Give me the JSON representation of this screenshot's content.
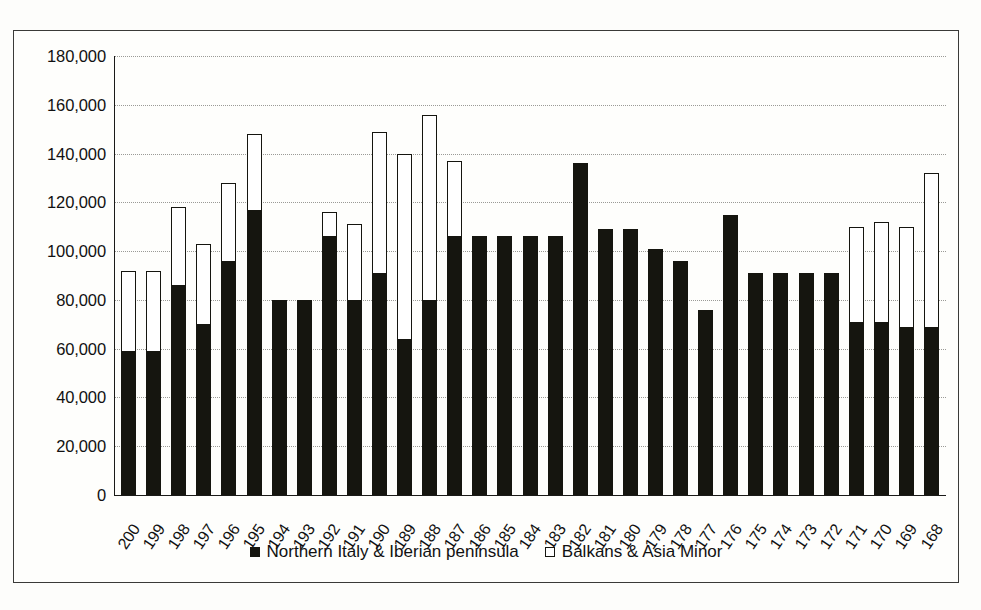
{
  "chart_data": {
    "type": "bar",
    "subtype": "stacked",
    "title": "",
    "xlabel": "",
    "ylabel": "",
    "ylim": [
      0,
      180000
    ],
    "ytick_step": 20000,
    "ytick_labels": [
      "180,000",
      "160,000",
      "140,000",
      "120,000",
      "100,000",
      "80,000",
      "60,000",
      "40,000",
      "20,000",
      "0"
    ],
    "ytick_values": [
      180000,
      160000,
      140000,
      120000,
      100000,
      80000,
      60000,
      40000,
      20000,
      0
    ],
    "grid": true,
    "grid_axis": "y",
    "legend_position": "bottom-center",
    "categories": [
      "200",
      "199",
      "198",
      "197",
      "196",
      "195",
      "194",
      "193",
      "192",
      "191",
      "190",
      "189",
      "188",
      "187",
      "186",
      "185",
      "184",
      "183",
      "182",
      "181",
      "180",
      "179",
      "178",
      "177",
      "176",
      "175",
      "174",
      "173",
      "172",
      "171",
      "170",
      "169",
      "168"
    ],
    "series": [
      {
        "name": "Northern Italy & Iberian peninsula",
        "marker": "filled-square",
        "color": "#15150f",
        "values": [
          59000,
          59000,
          86000,
          70000,
          96000,
          117000,
          80000,
          80000,
          106000,
          80000,
          91000,
          64000,
          80000,
          106000,
          106000,
          106000,
          106000,
          106000,
          136000,
          109000,
          109000,
          101000,
          96000,
          76000,
          115000,
          91000,
          91000,
          91000,
          91000,
          71000,
          71000,
          69000,
          69000
        ]
      },
      {
        "name": "Balkans & Asia Minor",
        "marker": "open-square",
        "color": "#ffffff",
        "values": [
          33000,
          33000,
          32000,
          33000,
          32000,
          31000,
          0,
          0,
          10000,
          31000,
          58000,
          76000,
          76000,
          31000,
          0,
          0,
          0,
          0,
          0,
          0,
          0,
          0,
          0,
          0,
          0,
          0,
          0,
          0,
          0,
          39000,
          41000,
          41000,
          63000
        ]
      }
    ],
    "totals": [
      92000,
      92000,
      118000,
      103000,
      128000,
      148000,
      80000,
      80000,
      116000,
      111000,
      149000,
      140000,
      156000,
      137000,
      106000,
      106000,
      106000,
      106000,
      136000,
      109000,
      109000,
      101000,
      96000,
      76000,
      115000,
      91000,
      91000,
      91000,
      91000,
      110000,
      112000,
      110000,
      132000
    ]
  },
  "legend": {
    "entries": [
      {
        "label": "Northern Italy & Iberian peninsula",
        "swatch": "filled-square"
      },
      {
        "label": "Balkans & Asia Minor",
        "swatch": "open-square"
      }
    ]
  },
  "colors": {
    "series_filled": "#15150f",
    "series_open": "#ffffff",
    "axis": "#1a1a18",
    "gridline": "#9a9a96",
    "frame": "#3a3a38",
    "background": "#fdfdfb"
  }
}
